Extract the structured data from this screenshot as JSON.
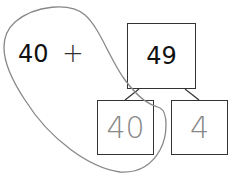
{
  "expression": {
    "left_term": "40",
    "operator": "+"
  },
  "number_bond": {
    "whole": "49",
    "parts": [
      "40",
      "4"
    ]
  },
  "annotation": {
    "type": "hand-drawn loop",
    "color": "#888888"
  }
}
